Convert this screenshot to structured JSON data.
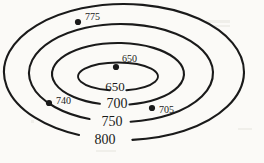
{
  "figure": {
    "name": "topographic-contour-map",
    "background_color": "#fbfaf7",
    "line_color": "#1a1a1a"
  },
  "chart_data": {
    "type": "contour",
    "title": "",
    "xlabel": "",
    "ylabel": "",
    "contour_interval": 50,
    "units": "feet",
    "contours": [
      {
        "label": "650",
        "value": 650,
        "index": 0,
        "shape": "ellipse",
        "cx": 118,
        "cy": 76.5,
        "rx": 40,
        "ry": 14,
        "label_x": 115,
        "label_y": 88,
        "gap_start_deg": 78,
        "gap_end_deg": 102
      },
      {
        "label": "700",
        "value": 700,
        "index": 1,
        "shape": "ellipse",
        "cx": 118,
        "cy": 74,
        "rx": 66,
        "ry": 31,
        "label_x": 117,
        "label_y": 105,
        "gap_start_deg": 80,
        "gap_end_deg": 106
      },
      {
        "label": "750",
        "value": 750,
        "index": 2,
        "shape": "ellipse",
        "cx": 121,
        "cy": 73,
        "rx": 92,
        "ry": 49,
        "label_x": 112,
        "label_y": 123,
        "gap_start_deg": 84,
        "gap_end_deg": 110
      },
      {
        "label": "800",
        "value": 800,
        "index": 3,
        "shape": "ellipse",
        "cx": 124,
        "cy": 72,
        "rx": 120,
        "ry": 68,
        "label_x": 105,
        "label_y": 141,
        "gap_start_deg": 86,
        "gap_end_deg": 112
      }
    ],
    "spot_elevations": [
      {
        "label": "775",
        "value": 775,
        "point_x": 78,
        "point_y": 22,
        "label_x": 85,
        "label_y": 18,
        "marker": "filled-dot"
      },
      {
        "label": "650",
        "value": 650,
        "point_x": 116,
        "point_y": 67,
        "label_x": 122,
        "label_y": 60,
        "marker": "filled-dot"
      },
      {
        "label": "740",
        "value": 740,
        "point_x": 49,
        "point_y": 103,
        "label_x": 56,
        "label_y": 102,
        "marker": "filled-dot"
      },
      {
        "label": "705",
        "value": 705,
        "point_x": 152,
        "point_y": 108,
        "label_x": 159,
        "label_y": 111,
        "marker": "filled-dot"
      }
    ]
  }
}
